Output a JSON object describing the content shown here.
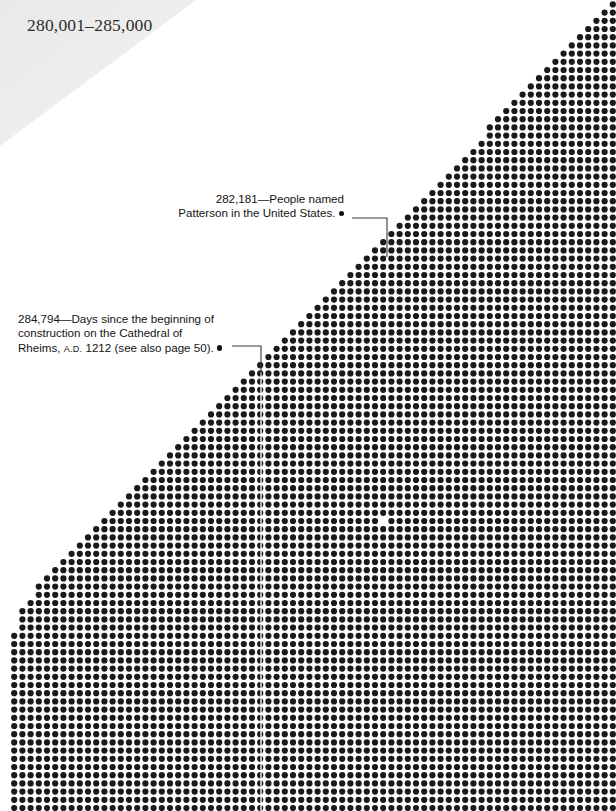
{
  "page": {
    "width": 616,
    "height": 811,
    "background_color": "#ffffff",
    "dot_color": "#1a1a1a",
    "header_band_color": "#ededed"
  },
  "header": {
    "range_label": "280,001–285,000"
  },
  "annotations": [
    {
      "id": "patterson",
      "number": "282,181",
      "dash": "—",
      "line1": "282,181—People named",
      "line2": "Patterson in the United States.",
      "marker": "bullet-dot"
    },
    {
      "id": "rheims",
      "number": "284,794",
      "dash": "—",
      "line1": "284,794—Days since the beginning of",
      "line2": "construction on the Cathedral of",
      "line3_a": "Rheims, ",
      "line3_smallcaps": "A.D.",
      "line3_b": " 1212 (see also page 50).",
      "marker": "bullet-dot"
    }
  ],
  "chart_data": {
    "type": "scatter",
    "title": "280,001–285,000",
    "grid_spacing_px": 8.2,
    "dot_radius_px": 3.1,
    "grid_columns": 75,
    "grid_rows": 99,
    "xlabel": "",
    "ylabel": "",
    "callouts": [
      {
        "label": "282,181 People named Patterson in the United States.",
        "value": 282181,
        "target_px": [
          385,
          246
        ]
      },
      {
        "label": "284,794 Days since the beginning of construction on the Cathedral of Rheims, A.D. 1212 (see also page 50).",
        "value": 284794,
        "target_px": [
          261,
          372
        ]
      }
    ],
    "missing_dots_px": [
      [
        385,
        520
      ]
    ],
    "legend": "none",
    "grid": false
  }
}
